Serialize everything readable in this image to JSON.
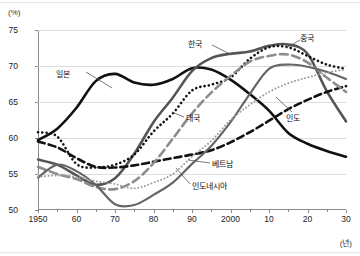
{
  "axes": {
    "y_unit_label": "(%)",
    "x_unit_label": "(년)",
    "y_ticks": [
      "50",
      "55",
      "60",
      "65",
      "70",
      "75"
    ],
    "x_ticks": [
      "1950",
      "60",
      "70",
      "80",
      "90",
      "2000",
      "10",
      "20",
      "30"
    ]
  },
  "annotations": {
    "japan": "일본",
    "korea": "한국",
    "china": "중국",
    "india": "인도",
    "thailand": "태국",
    "vietnam": "베트남",
    "indonesia": "인도네시아"
  },
  "chart_data": {
    "type": "line",
    "title": "",
    "xlabel": "(년)",
    "ylabel": "(%)",
    "xlim": [
      1950,
      2030
    ],
    "ylim": [
      50,
      75
    ],
    "grid": true,
    "legend": "inline-annotations",
    "x": [
      1950,
      1955,
      1960,
      1965,
      1970,
      1975,
      1980,
      1985,
      1990,
      1995,
      2000,
      2005,
      2010,
      2015,
      2020,
      2025,
      2030
    ],
    "series": [
      {
        "name": "일본",
        "color": "#111111",
        "style": "solid-thick",
        "values": [
          59.7,
          61.3,
          64.2,
          67.9,
          68.9,
          67.7,
          67.4,
          68.2,
          69.7,
          69.5,
          68.1,
          66.1,
          63.8,
          60.7,
          59.2,
          58.2,
          57.4
        ]
      },
      {
        "name": "한국",
        "color": "#555555",
        "style": "solid-thick",
        "values": [
          57.0,
          56.3,
          54.8,
          53.5,
          54.4,
          57.8,
          62.2,
          65.6,
          69.3,
          71.1,
          71.7,
          72.0,
          72.8,
          73.0,
          71.7,
          66.5,
          62.3
        ]
      },
      {
        "name": "중국",
        "color": "#111111",
        "style": "dotted",
        "values": [
          60.8,
          60.2,
          56.4,
          55.9,
          56.3,
          57.7,
          60.9,
          63.4,
          66.6,
          67.4,
          68.4,
          71.0,
          72.6,
          72.6,
          71.4,
          70.2,
          69.6
        ]
      },
      {
        "name": "인도",
        "color": "#111111",
        "style": "dashed",
        "values": [
          59.5,
          58.7,
          57.2,
          56.0,
          55.9,
          56.2,
          56.7,
          57.2,
          57.7,
          58.3,
          59.4,
          60.8,
          62.4,
          64.0,
          65.3,
          66.4,
          67.2
        ]
      },
      {
        "name": "태국",
        "color": "#8c8c8c",
        "style": "dashed-thick",
        "values": [
          56.0,
          55.0,
          54.3,
          53.2,
          52.9,
          54.0,
          56.5,
          59.9,
          63.4,
          66.3,
          68.6,
          70.6,
          71.4,
          71.6,
          70.5,
          68.4,
          66.4
        ]
      },
      {
        "name": "베트남",
        "color": "#666666",
        "style": "solid",
        "values": [
          54.5,
          56.3,
          55.4,
          53.5,
          50.8,
          50.7,
          52.1,
          53.8,
          56.4,
          58.9,
          62.2,
          66.1,
          69.6,
          70.2,
          69.9,
          69.2,
          68.2
        ]
      },
      {
        "name": "인도네시아",
        "color": "#999999",
        "style": "dotted-fine",
        "values": [
          54.6,
          54.8,
          54.6,
          54.0,
          53.6,
          53.0,
          53.8,
          55.0,
          57.4,
          59.6,
          62.5,
          64.6,
          66.4,
          67.6,
          68.4,
          69.1,
          69.5
        ]
      }
    ]
  }
}
